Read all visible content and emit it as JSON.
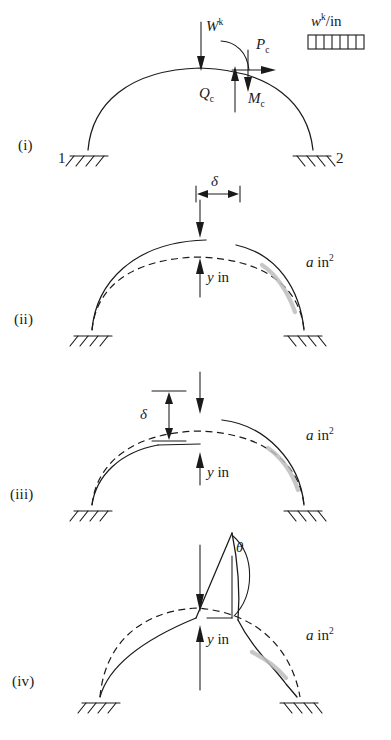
{
  "figure": {
    "panels": [
      {
        "id": "i",
        "label": "(i)",
        "caption": "Free body of arch with crown loads",
        "node_left": "1",
        "node_right": "2",
        "annotations": [
          {
            "name": "applied-load",
            "text": "W",
            "sup": "k",
            "sub": "",
            "kind": "force-down"
          },
          {
            "name": "crown-thrust",
            "text": "P",
            "sup": "",
            "sub": "c",
            "kind": "force-right"
          },
          {
            "name": "crown-shear",
            "text": "Q",
            "sup": "",
            "sub": "c",
            "kind": "force-up"
          },
          {
            "name": "crown-moment",
            "text": "M",
            "sup": "",
            "sub": "c",
            "kind": "moment"
          }
        ],
        "legend": {
          "name": "distributed-load-legend",
          "text": "w",
          "sup": "k",
          "rest": "/in",
          "divisions": 7
        }
      },
      {
        "id": "ii",
        "label": "(ii)",
        "caption": "Small crown deflection, horizontal delta offset",
        "annotations": [
          {
            "name": "delta-dimension",
            "text": "δ"
          },
          {
            "name": "rise-label",
            "text": "y",
            "rest": " in"
          },
          {
            "name": "area-label",
            "text": "a",
            "rest": " in",
            "sup": "2"
          }
        ]
      },
      {
        "id": "iii",
        "label": "(iii)",
        "caption": "Larger crown deflection, vertical delta offset",
        "annotations": [
          {
            "name": "delta-dimension",
            "text": "δ"
          },
          {
            "name": "rise-label",
            "text": "y",
            "rest": " in"
          },
          {
            "name": "area-label",
            "text": "a",
            "rest": " in",
            "sup": "2"
          }
        ]
      },
      {
        "id": "iv",
        "label": "(iv)",
        "caption": "Snap-through collapse with kink rotation theta",
        "annotations": [
          {
            "name": "kink-angle",
            "text": "θ"
          },
          {
            "name": "rise-label",
            "text": "y",
            "rest": " in"
          },
          {
            "name": "area-label",
            "text": "a",
            "rest": " in",
            "sup": "2"
          }
        ]
      }
    ],
    "colors": {
      "ink": "#1a1a1a",
      "shade": "#bdbdbd",
      "background": "#ffffff"
    }
  }
}
